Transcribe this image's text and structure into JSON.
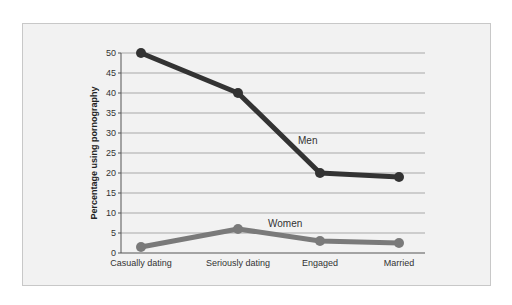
{
  "chart_data": {
    "type": "line",
    "title": "",
    "xlabel": "",
    "ylabel": "Percentage using pornography",
    "ylim": [
      0,
      50
    ],
    "yticks": [
      0,
      5,
      10,
      15,
      20,
      25,
      30,
      35,
      40,
      45,
      50
    ],
    "grid": true,
    "categories": [
      "Casually dating",
      "Seriously dating",
      "Engaged",
      "Married"
    ],
    "series": [
      {
        "name": "Men",
        "values": [
          50,
          40,
          20,
          19
        ],
        "color": "#333333"
      },
      {
        "name": "Women",
        "values": [
          1.5,
          6,
          3,
          2.5
        ],
        "color": "#7a7a7a"
      }
    ],
    "annotations": [
      {
        "text": "Men",
        "near_series": "Men"
      },
      {
        "text": "Women",
        "near_series": "Women"
      }
    ]
  }
}
